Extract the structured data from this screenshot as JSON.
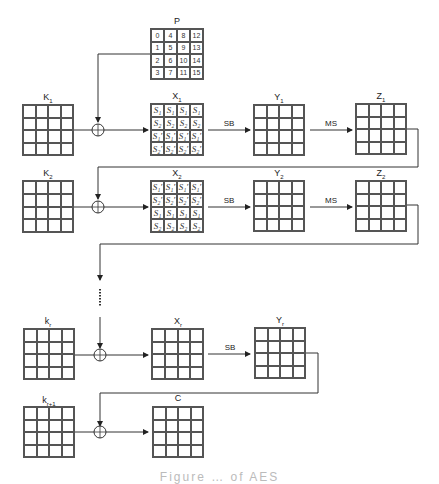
{
  "diagram": {
    "plaintext": {
      "label": "P",
      "cells": [
        "0",
        "4",
        "8",
        "12",
        "1",
        "5",
        "9",
        "13",
        "2",
        "6",
        "10",
        "14",
        "3",
        "7",
        "11",
        "15"
      ]
    },
    "rows": [
      {
        "key_label": "K",
        "key_sub": "1",
        "state_label": "X",
        "state_sub": "1",
        "state_cells": [
          "S₁",
          "S₁",
          "S₁",
          "S₁",
          "S₂",
          "S₂",
          "S₂",
          "S₂",
          "S₁′",
          "S₁′",
          "S₁′",
          "S₁′",
          "S₂′",
          "S₂′",
          "S₂′",
          "S₂′"
        ],
        "op1": "SB",
        "y_label": "Y",
        "y_sub": "1",
        "op2": "MS",
        "z_label": "Z",
        "z_sub": "1"
      },
      {
        "key_label": "K",
        "key_sub": "2",
        "state_label": "X",
        "state_sub": "2",
        "state_cells": [
          "S₁′",
          "S₁′",
          "S₁′",
          "S₁′",
          "S₂′",
          "S₂′",
          "S₂′",
          "S₂′",
          "S₁",
          "S₁",
          "S₁",
          "S₁",
          "S₂",
          "S₂",
          "S₂",
          "S₂"
        ],
        "op1": "SB",
        "y_label": "Y",
        "y_sub": "2",
        "op2": "MS",
        "z_label": "Z",
        "z_sub": "2"
      },
      {
        "key_label": "k",
        "key_sub": "r",
        "state_label": "X",
        "state_sub": "r",
        "op1": "SB",
        "y_label": "Y",
        "y_sub": "r"
      },
      {
        "key_label": "k",
        "key_sub": "r+1",
        "state_label": "C",
        "state_sub": ""
      }
    ],
    "ellipsis": "⋮",
    "xor_symbol": "⊕",
    "caption": "Figure … of AES"
  }
}
